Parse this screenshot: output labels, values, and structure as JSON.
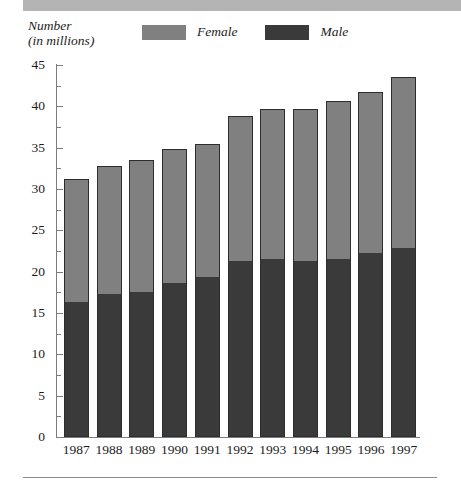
{
  "decor": {
    "top_band_color": "#b4b4b4",
    "bottom_rule_color": "#8c8c8c"
  },
  "axis_caption": {
    "line1": "Number",
    "line2": "(in millions)"
  },
  "legend": {
    "position": "top-center",
    "entries": [
      {
        "label": "Female",
        "color": "#808080",
        "swatch_name": "female-swatch"
      },
      {
        "label": "Male",
        "color": "#3a3a3a",
        "swatch_name": "male-swatch"
      }
    ]
  },
  "chart_data": {
    "type": "bar",
    "subtype": "stacked-vertical",
    "title": "",
    "subtitle": "",
    "xlabel": "",
    "ylabel": "Number (in millions)",
    "ylim": [
      0,
      45
    ],
    "yticks": [
      0,
      5,
      10,
      15,
      20,
      25,
      30,
      35,
      40,
      45
    ],
    "ytick_labels": [
      "0",
      "5",
      "10",
      "15",
      "20",
      "25",
      "30",
      "35",
      "40",
      "45"
    ],
    "minor_yticks": [
      2.5,
      7.5,
      12.5,
      17.5,
      22.5,
      27.5,
      32.5,
      37.5,
      42.5
    ],
    "grid": false,
    "legend_position": "top-center",
    "categories": [
      "1987",
      "1988",
      "1989",
      "1990",
      "1991",
      "1992",
      "1993",
      "1994",
      "1995",
      "1996",
      "1997"
    ],
    "series": [
      {
        "name": "Male",
        "color": "#3a3a3a",
        "values": [
          16.3,
          17.3,
          17.6,
          18.6,
          19.3,
          21.3,
          21.5,
          21.3,
          21.5,
          22.2,
          22.9
        ]
      },
      {
        "name": "Female",
        "color": "#808080",
        "values": [
          14.9,
          15.5,
          15.9,
          16.2,
          16.2,
          17.5,
          18.2,
          18.4,
          19.1,
          19.5,
          20.6
        ]
      }
    ],
    "totals": [
      31.2,
      32.8,
      33.5,
      34.8,
      35.5,
      38.8,
      39.7,
      39.7,
      40.6,
      41.7,
      43.5
    ]
  }
}
